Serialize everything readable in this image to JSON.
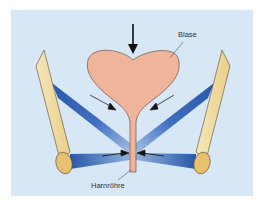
{
  "diagram": {
    "type": "anatomical-illustration",
    "labels": {
      "bladder": "Blase",
      "urethra": "Harnröhre"
    },
    "colors": {
      "panel_background": "#d8e7f5",
      "bladder_fill": "#f0b49a",
      "bone_fill": "#f2dca0",
      "bone_cut_fill": "#e8c070",
      "muscle_dark": "#2a58a8",
      "muscle_light": "#9bb8e0",
      "arrow": "#111111"
    },
    "elements": [
      {
        "name": "pressure-arrow",
        "description": "downward arrow above bladder"
      },
      {
        "name": "bladder",
        "label": "Blase"
      },
      {
        "name": "urethra",
        "label": "Harnröhre"
      },
      {
        "name": "left-bone"
      },
      {
        "name": "right-bone"
      },
      {
        "name": "left-upper-muscle-band"
      },
      {
        "name": "right-upper-muscle-band"
      },
      {
        "name": "left-lower-muscle-band"
      },
      {
        "name": "right-lower-muscle-band"
      },
      {
        "name": "compression-arrows",
        "count": 4
      }
    ]
  }
}
